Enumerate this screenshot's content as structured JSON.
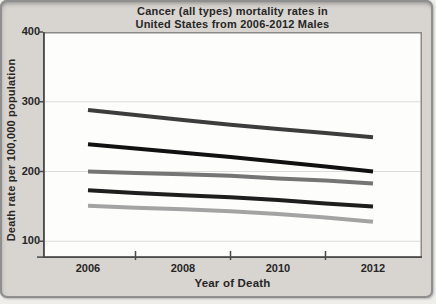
{
  "colors": {
    "card_background": "#d8d5d0",
    "card_border": "#8f8f8f",
    "plot_background": "#fdfdfc",
    "plot_border": "#8a8a8a",
    "axis": "#4a4a4a",
    "gridline": "#dcdcdc",
    "text": "#262626"
  },
  "chart_data": {
    "type": "line",
    "title_line1": "Cancer (all types) mortality rates in",
    "title_line2": "United States from 2006-2012 Males",
    "xlabel": "Year of Death",
    "ylabel": "Death rate per 100,000 population",
    "x": [
      2006,
      2007,
      2008,
      2009,
      2010,
      2011,
      2012
    ],
    "xlim": [
      2006,
      2012
    ],
    "ylim": [
      76,
      400
    ],
    "x_tick_labels": [
      "2006",
      "2008",
      "2010",
      "2012"
    ],
    "x_minor_tick_years": [
      2007,
      2009,
      2011
    ],
    "y_ticks": [
      400,
      300,
      200,
      100
    ],
    "y_tick_labels": [
      "400",
      "300",
      "200",
      "100"
    ],
    "grid_y": [
      300,
      200,
      100
    ],
    "grid": "horizontal",
    "legend": "none",
    "line_width": 4,
    "series": [
      {
        "name": "line-1-dark-gray",
        "color": "#3d3d3d",
        "values": [
          288,
          281,
          274,
          267,
          261,
          255,
          249
        ]
      },
      {
        "name": "line-2-black",
        "color": "#111111",
        "values": [
          239,
          233,
          227,
          221,
          214,
          207,
          200
        ]
      },
      {
        "name": "line-3-medium-gray",
        "color": "#757575",
        "values": [
          200,
          198,
          196,
          194,
          190,
          187,
          183
        ]
      },
      {
        "name": "line-4-black",
        "color": "#1e1e1e",
        "values": [
          173,
          169,
          166,
          163,
          159,
          154,
          150
        ]
      },
      {
        "name": "line-5-light-gray",
        "color": "#a3a3a3",
        "values": [
          151,
          148,
          146,
          143,
          139,
          134,
          128
        ]
      }
    ]
  }
}
